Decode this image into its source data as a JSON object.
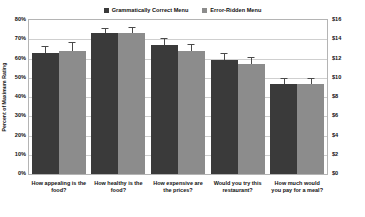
{
  "chart_data": {
    "type": "bar",
    "title": "",
    "xlabel": "",
    "ylabel": "Percent of Maximum Rating",
    "y2label": "",
    "ylim": [
      0,
      80
    ],
    "y2lim": [
      0,
      16
    ],
    "grid": true,
    "legend_position": "top-center",
    "categories": [
      "How appealing is the food?",
      "How healthy is the food?",
      "How expensive are the prices?",
      "Would you try this restaurant?",
      "How much would you pay for a meal?"
    ],
    "series": [
      {
        "name": "Grammatically Correct Menu",
        "color": "#3a3a3a",
        "values": [
          63,
          73,
          67,
          59,
          47
        ],
        "errors": [
          3.5,
          3.0,
          3.5,
          4.0,
          3.0
        ]
      },
      {
        "name": "Error-Ridden Menu",
        "color": "#8c8c8c",
        "values": [
          64,
          73,
          64,
          57,
          47
        ],
        "errors": [
          4.5,
          3.5,
          3.5,
          4.0,
          3.0
        ]
      }
    ],
    "yticks_left": [
      "0%",
      "10%",
      "20%",
      "30%",
      "40%",
      "50%",
      "60%",
      "70%",
      "80%"
    ],
    "yticks_right": [
      "$0",
      "$2",
      "$4",
      "$6",
      "$8",
      "$10",
      "$12",
      "$14",
      "$16"
    ],
    "note": "Fifth category 'How much would you pay for a meal?' is read against the right-hand dollar axis."
  },
  "legend": {
    "entries": [
      {
        "label": "Grammatically Correct Menu",
        "color": "#3a3a3a"
      },
      {
        "label": "Error-Ridden Menu",
        "color": "#8c8c8c"
      }
    ]
  },
  "axes": {
    "left_title": "Percent of Maximum Rating"
  }
}
